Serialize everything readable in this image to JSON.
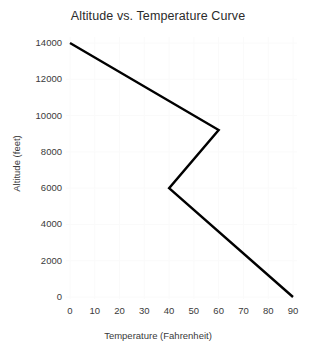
{
  "chart_data": {
    "type": "line",
    "title": "Altitude vs. Temperature Curve",
    "xlabel": "Temperature (Fahrenheit)",
    "ylabel": "Altitude (feet)",
    "xlim": [
      0,
      90
    ],
    "ylim": [
      0,
      14000
    ],
    "grid": true,
    "legend": null,
    "line_color": "#000000",
    "line_width": 2.4,
    "xticks": [
      0,
      10,
      20,
      30,
      40,
      50,
      60,
      70,
      80,
      90
    ],
    "xtick_labels": [
      "0",
      "10",
      "20",
      "30",
      "40",
      "50",
      "60",
      "70",
      "80",
      "90"
    ],
    "yticks": [
      0,
      2000,
      4000,
      6000,
      8000,
      10000,
      12000,
      14000
    ],
    "ytick_labels": [
      "0",
      "2000",
      "4000",
      "6000",
      "8000",
      "10000",
      "12000",
      "14000"
    ],
    "x": [
      0,
      60,
      40,
      90
    ],
    "y": [
      14000,
      9200,
      6000,
      0
    ],
    "points": [
      {
        "temperature": 0,
        "altitude": 14000
      },
      {
        "temperature": 60,
        "altitude": 9200
      },
      {
        "temperature": 40,
        "altitude": 6000
      },
      {
        "temperature": 90,
        "altitude": 0
      }
    ]
  }
}
